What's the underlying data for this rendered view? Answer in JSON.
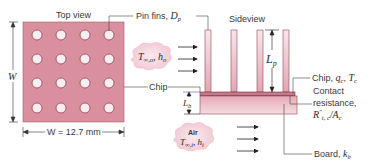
{
  "top_view": {
    "title": "Top view",
    "width_symbol": "W",
    "width_dimension": "W = 12.7 mm",
    "grid_rows": 4,
    "grid_cols": 4
  },
  "side_view": {
    "title": "Sideview",
    "fin_length_symbol": "L",
    "fin_length_sub": "p",
    "board_thickness_symbol": "L",
    "board_thickness_sub": "b"
  },
  "labels": {
    "pin_fins": "Pin fins, ",
    "pin_fins_sym": "D",
    "pin_fins_sub": "p",
    "chip_left": "Chip",
    "chip_right": "Chip, ",
    "chip_q": "q",
    "chip_q_sub": "c",
    "chip_T": "T",
    "chip_T_sub": "c",
    "contact_line1": "Contact",
    "contact_line2": "resistance,",
    "contact_R": "R",
    "contact_R_sup": "″",
    "contact_R_sub": "t, c",
    "contact_A": "/A",
    "contact_A_sub": "c",
    "board": "Board, ",
    "board_k": "k",
    "board_k_sub": "b"
  },
  "flows": {
    "outer": {
      "T": "T",
      "T_sub": "∞,o",
      "h": "h",
      "h_sub": "o"
    },
    "inner": {
      "title": "Air",
      "T": "T",
      "T_sub": "∞,i",
      "h": "h",
      "h_sub": "i"
    }
  },
  "colors": {
    "pink_fill": "#d98f9e",
    "pink_light": "#f3d3da",
    "line": "#555555",
    "chip_line": "#8a7fd6"
  }
}
